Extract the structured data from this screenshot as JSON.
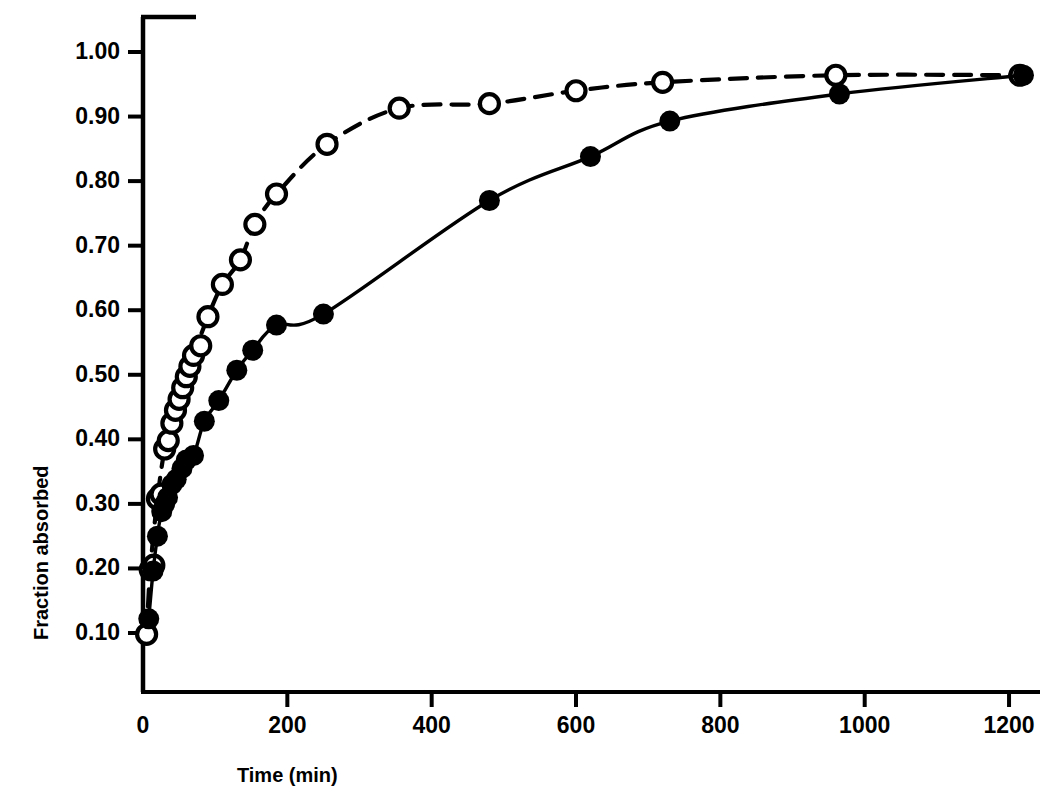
{
  "chart_data": {
    "type": "scatter",
    "title": "",
    "subtitle": "",
    "xlabel": "Time (min)",
    "ylabel": "Fraction absorbed",
    "xlim": [
      0,
      1240
    ],
    "ylim": [
      0.0,
      1.04
    ],
    "grid": false,
    "legend": "none",
    "xticks": [
      0,
      200,
      400,
      600,
      800,
      1000,
      1200
    ],
    "xticklabels": [
      "0",
      "200",
      "400",
      "600",
      "800",
      "1000",
      "1200"
    ],
    "yticks": [
      0.1,
      0.2,
      0.3,
      0.4,
      0.5,
      0.6,
      0.7,
      0.8,
      0.9,
      1.0
    ],
    "yticklabels": [
      "0.10",
      "0.20",
      "0.30",
      "0.40",
      "0.50",
      "0.60",
      "0.70",
      "0.80",
      "0.90",
      "1.00"
    ],
    "series": [
      {
        "name": "open-circles",
        "marker": "open-circle",
        "linestyle": "dashed",
        "color": "#000000",
        "points": [
          [
            5,
            0.098
          ],
          [
            10,
            0.198
          ],
          [
            15,
            0.205
          ],
          [
            20,
            0.308
          ],
          [
            25,
            0.315
          ],
          [
            30,
            0.385
          ],
          [
            35,
            0.398
          ],
          [
            40,
            0.425
          ],
          [
            45,
            0.445
          ],
          [
            50,
            0.462
          ],
          [
            55,
            0.48
          ],
          [
            60,
            0.497
          ],
          [
            65,
            0.513
          ],
          [
            70,
            0.53
          ],
          [
            80,
            0.545
          ],
          [
            90,
            0.59
          ],
          [
            110,
            0.64
          ],
          [
            135,
            0.678
          ],
          [
            155,
            0.733
          ],
          [
            185,
            0.78
          ],
          [
            255,
            0.857
          ],
          [
            355,
            0.913
          ],
          [
            480,
            0.92
          ],
          [
            600,
            0.94
          ],
          [
            720,
            0.953
          ],
          [
            960,
            0.964
          ],
          [
            1215,
            0.964
          ]
        ]
      },
      {
        "name": "filled-circles",
        "marker": "filled-circle",
        "linestyle": "solid",
        "color": "#000000",
        "points": [
          [
            8,
            0.122
          ],
          [
            14,
            0.196
          ],
          [
            20,
            0.25
          ],
          [
            26,
            0.288
          ],
          [
            30,
            0.3
          ],
          [
            34,
            0.31
          ],
          [
            40,
            0.33
          ],
          [
            46,
            0.338
          ],
          [
            54,
            0.355
          ],
          [
            60,
            0.368
          ],
          [
            70,
            0.375
          ],
          [
            85,
            0.428
          ],
          [
            105,
            0.46
          ],
          [
            130,
            0.507
          ],
          [
            152,
            0.538
          ],
          [
            185,
            0.577
          ],
          [
            250,
            0.594
          ],
          [
            480,
            0.77
          ],
          [
            620,
            0.838
          ],
          [
            730,
            0.893
          ],
          [
            965,
            0.935
          ],
          [
            1220,
            0.964
          ]
        ]
      }
    ]
  },
  "axes": {
    "x_axis_name": "time-axis",
    "y_axis_name": "fraction-absorbed-axis"
  }
}
